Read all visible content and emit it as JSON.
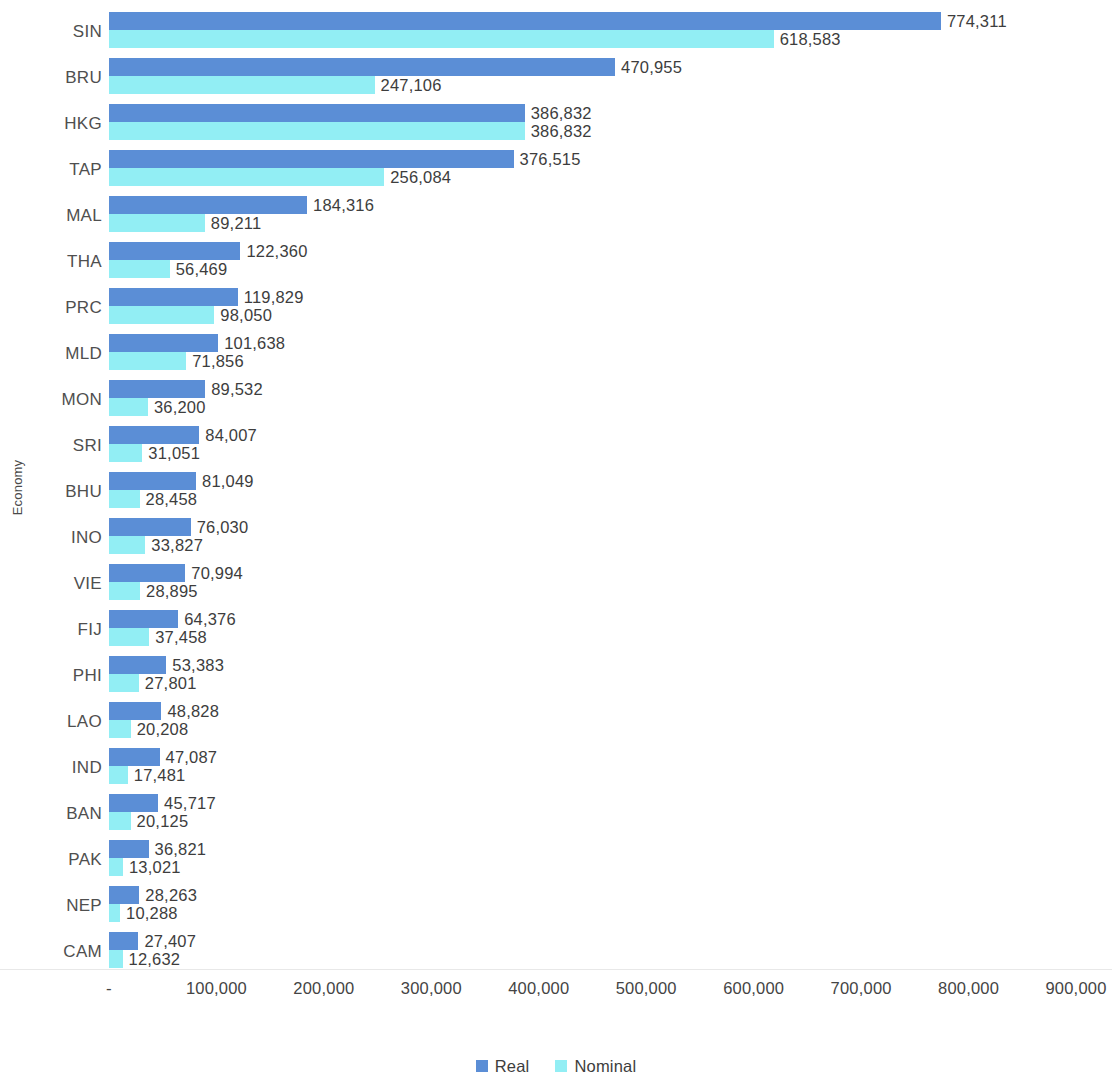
{
  "chart_data": {
    "type": "bar",
    "orientation": "horizontal",
    "title": "",
    "xlabel": "",
    "ylabel": "Economy",
    "xlim": [
      0,
      900000
    ],
    "grid": false,
    "legend_position": "bottom",
    "categories": [
      "SIN",
      "BRU",
      "HKG",
      "TAP",
      "MAL",
      "THA",
      "PRC",
      "MLD",
      "MON",
      "SRI",
      "BHU",
      "INO",
      "VIE",
      "FIJ",
      "PHI",
      "LAO",
      "IND",
      "BAN",
      "PAK",
      "NEP",
      "CAM"
    ],
    "x_tick_values": [
      0,
      100000,
      200000,
      300000,
      400000,
      500000,
      600000,
      700000,
      800000,
      900000
    ],
    "x_tick_labels": [
      "-",
      "100,000",
      "200,000",
      "300,000",
      "400,000",
      "500,000",
      "600,000",
      "700,000",
      "800,000",
      "900,000"
    ],
    "series": [
      {
        "name": "Real",
        "color": "#5b8ed6",
        "values": [
          774311,
          470955,
          386832,
          376515,
          184316,
          122360,
          119829,
          101638,
          89532,
          84007,
          81049,
          76030,
          70994,
          64376,
          53383,
          48828,
          47087,
          45717,
          36821,
          28263,
          27407
        ],
        "labels": [
          "774,311",
          "470,955",
          "386,832",
          "376,515",
          "184,316",
          "122,360",
          "119,829",
          "101,638",
          "89,532",
          "84,007",
          "81,049",
          "76,030",
          "70,994",
          "64,376",
          "53,383",
          "48,828",
          "47,087",
          "45,717",
          "36,821",
          "28,263",
          "27,407"
        ]
      },
      {
        "name": "Nominal",
        "color": "#92eef4",
        "values": [
          618583,
          247106,
          386832,
          256084,
          89211,
          56469,
          98050,
          71856,
          36200,
          31051,
          28458,
          33827,
          28895,
          37458,
          27801,
          20208,
          17481,
          20125,
          13021,
          10288,
          12632
        ],
        "labels": [
          "618,583",
          "247,106",
          "386,832",
          "256,084",
          "89,211",
          "56,469",
          "98,050",
          "71,856",
          "36,200",
          "31,051",
          "28,458",
          "33,827",
          "28,895",
          "37,458",
          "27,801",
          "20,208",
          "17,481",
          "20,125",
          "13,021",
          "10,288",
          "12,632"
        ]
      }
    ]
  },
  "legend": {
    "items": [
      {
        "label": "Real",
        "color": "#5b8ed6"
      },
      {
        "label": "Nominal",
        "color": "#92eef4"
      }
    ]
  }
}
